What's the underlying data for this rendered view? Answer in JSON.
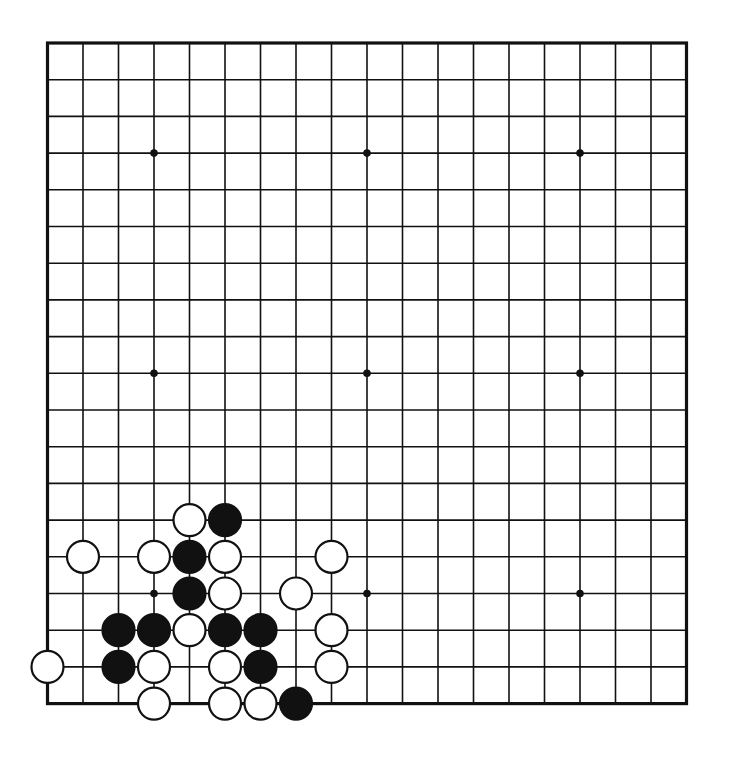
{
  "board": {
    "size": 19,
    "origin_x": 47.5,
    "origin_y": 43,
    "spacing_x": 35.5,
    "spacing_y": 36.7,
    "line_color": "#111111",
    "background": "#ffffff",
    "star_points": [
      [
        3,
        3
      ],
      [
        9,
        3
      ],
      [
        15,
        3
      ],
      [
        3,
        9
      ],
      [
        9,
        9
      ],
      [
        15,
        9
      ],
      [
        3,
        15
      ],
      [
        9,
        15
      ],
      [
        15,
        15
      ]
    ]
  },
  "stones": [
    {
      "color": "white",
      "col": 4,
      "row": 13
    },
    {
      "color": "black",
      "col": 5,
      "row": 13
    },
    {
      "color": "white",
      "col": 1,
      "row": 14
    },
    {
      "color": "white",
      "col": 3,
      "row": 14
    },
    {
      "color": "black",
      "col": 4,
      "row": 14
    },
    {
      "color": "white",
      "col": 5,
      "row": 14
    },
    {
      "color": "white",
      "col": 8,
      "row": 14
    },
    {
      "color": "black",
      "col": 4,
      "row": 15
    },
    {
      "color": "white",
      "col": 5,
      "row": 15
    },
    {
      "color": "white",
      "col": 7,
      "row": 15
    },
    {
      "color": "black",
      "col": 2,
      "row": 16
    },
    {
      "color": "black",
      "col": 3,
      "row": 16
    },
    {
      "color": "white",
      "col": 4,
      "row": 16
    },
    {
      "color": "black",
      "col": 5,
      "row": 16
    },
    {
      "color": "black",
      "col": 6,
      "row": 16
    },
    {
      "color": "white",
      "col": 8,
      "row": 16
    },
    {
      "color": "white",
      "col": 0,
      "row": 17
    },
    {
      "color": "black",
      "col": 2,
      "row": 17
    },
    {
      "color": "white",
      "col": 3,
      "row": 17
    },
    {
      "color": "white",
      "col": 5,
      "row": 17
    },
    {
      "color": "black",
      "col": 6,
      "row": 17
    },
    {
      "color": "white",
      "col": 8,
      "row": 17
    },
    {
      "color": "white",
      "col": 3,
      "row": 18
    },
    {
      "color": "white",
      "col": 5,
      "row": 18
    },
    {
      "color": "white",
      "col": 6,
      "row": 18
    },
    {
      "color": "black",
      "col": 7,
      "row": 18
    }
  ],
  "stone_colors": {
    "black": "#111111",
    "white": "#ffffff",
    "outline": "#111111"
  }
}
